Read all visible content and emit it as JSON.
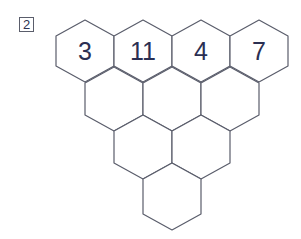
{
  "problem": {
    "number": "2"
  },
  "pyramid": {
    "rows": [
      [
        "3",
        "11",
        "4",
        "7"
      ],
      [
        "",
        "",
        ""
      ],
      [
        "",
        ""
      ],
      [
        ""
      ]
    ],
    "top_row": {
      "c0": "3",
      "c1": "11",
      "c2": "4",
      "c3": "7"
    }
  },
  "colors": {
    "stroke": "#5a5d6b",
    "text": "#2b2f52",
    "background": "#ffffff"
  }
}
